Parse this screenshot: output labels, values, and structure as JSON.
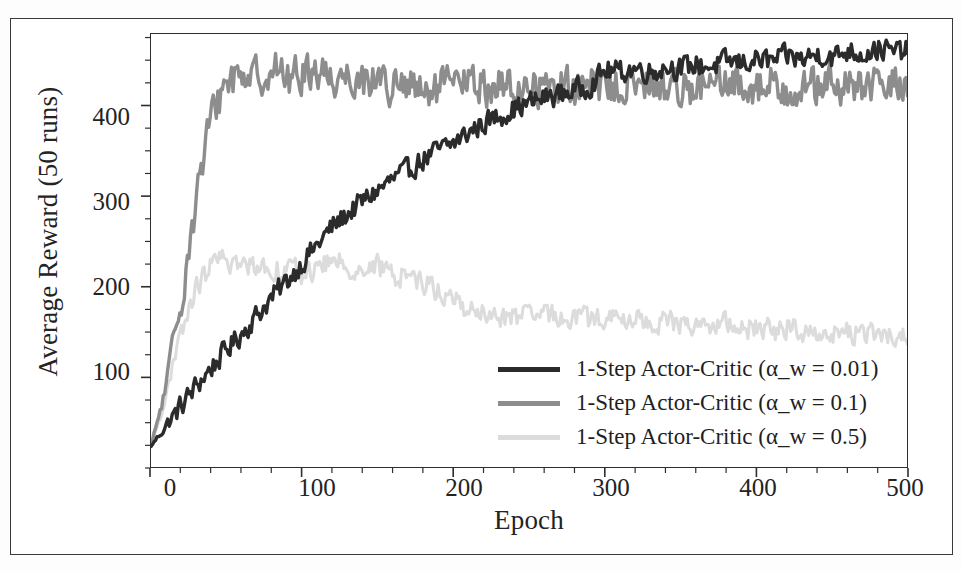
{
  "figure": {
    "y_axis_title": "Average Reward (50 runs)",
    "x_axis_title": "Epoch",
    "y_tick_labels": [
      "400",
      "300",
      "200",
      "100"
    ],
    "x_tick_labels": [
      "0",
      "100",
      "200",
      "300",
      "400",
      "500"
    ]
  },
  "legend": {
    "items": [
      {
        "label": "1-Step Actor-Critic (α_w = 0.01)",
        "color": "#2b2b2b",
        "swatch_name": "legend-swatch-alpha-001"
      },
      {
        "label": "1-Step Actor-Critic (α_w = 0.1)",
        "color": "#8d8d8d",
        "swatch_name": "legend-swatch-alpha-01"
      },
      {
        "label": "1-Step Actor-Critic (α_w = 0.5)",
        "color": "#dcdcdc",
        "swatch_name": "legend-swatch-alpha-05"
      }
    ]
  },
  "chart_data": {
    "type": "line",
    "title": "",
    "xlabel": "Epoch",
    "ylabel": "Average Reward (50 runs)",
    "xlim": [
      0,
      500
    ],
    "ylim": [
      0,
      480
    ],
    "xticks": [
      0,
      100,
      200,
      300,
      400,
      500
    ],
    "yticks": [
      100,
      200,
      300,
      400
    ],
    "grid": false,
    "legend_position": "lower-right-inside",
    "x": [
      0,
      10,
      20,
      30,
      40,
      50,
      60,
      70,
      80,
      90,
      100,
      110,
      120,
      130,
      140,
      150,
      160,
      170,
      180,
      190,
      200,
      210,
      220,
      230,
      240,
      250,
      260,
      270,
      280,
      290,
      300,
      310,
      320,
      330,
      340,
      350,
      360,
      370,
      380,
      390,
      400,
      410,
      420,
      430,
      440,
      450,
      460,
      470,
      480,
      490,
      500
    ],
    "series": [
      {
        "name": "1-Step Actor-Critic (α_w = 0.01)",
        "color": "#2b2b2b",
        "values": [
          25,
          48,
          70,
          92,
          112,
          132,
          150,
          170,
          190,
          208,
          228,
          248,
          268,
          282,
          296,
          308,
          320,
          330,
          342,
          352,
          360,
          372,
          382,
          390,
          398,
          404,
          410,
          414,
          418,
          424,
          440,
          438,
          442,
          438,
          444,
          442,
          446,
          444,
          450,
          448,
          452,
          450,
          456,
          452,
          458,
          454,
          462,
          458,
          464,
          460,
          462
        ],
        "noise": 16
      },
      {
        "name": "1-Step Actor-Critic (α_w = 0.1)",
        "color": "#8d8d8d",
        "values": [
          25,
          90,
          190,
          300,
          390,
          430,
          438,
          432,
          444,
          430,
          436,
          442,
          430,
          436,
          428,
          434,
          418,
          424,
          410,
          420,
          424,
          428,
          420,
          424,
          418,
          424,
          420,
          426,
          418,
          424,
          420,
          426,
          418,
          424,
          420,
          426,
          418,
          424,
          420,
          426,
          420,
          426,
          418,
          424,
          420,
          426,
          418,
          424,
          420,
          426,
          422
        ],
        "noise": 28
      },
      {
        "name": "1-Step Actor-Critic (α_w = 0.5)",
        "color": "#dcdcdc",
        "values": [
          25,
          80,
          150,
          200,
          226,
          232,
          222,
          228,
          218,
          224,
          214,
          222,
          230,
          224,
          218,
          224,
          212,
          216,
          206,
          196,
          186,
          176,
          170,
          166,
          170,
          166,
          172,
          166,
          170,
          164,
          168,
          162,
          166,
          160,
          164,
          158,
          162,
          156,
          160,
          154,
          158,
          152,
          156,
          150,
          154,
          148,
          152,
          146,
          150,
          144,
          148
        ],
        "noise": 16
      }
    ]
  }
}
